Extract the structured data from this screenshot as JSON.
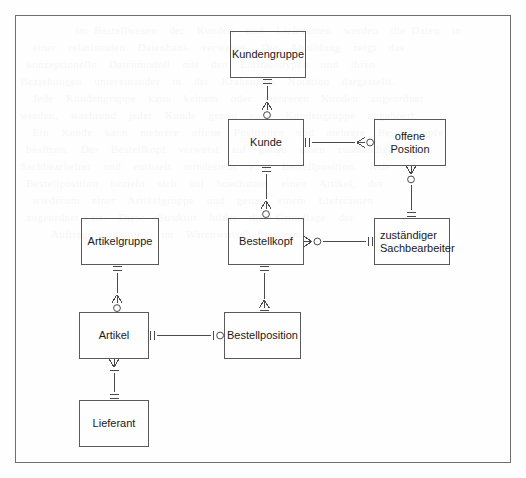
{
  "diagram": {
    "type": "entity-relationship-diagram",
    "notation": "crow's foot (Martin) notation",
    "frame": {
      "x": 15,
      "y": 15,
      "width": 496,
      "height": 448,
      "border_color": "#6e6e6e"
    },
    "canvas": {
      "width": 526,
      "height": 478,
      "background": "#fefefe"
    },
    "entity_border_color": "#5a5a5a",
    "line_color": "#4a4a4a",
    "text_color": "#1a1a1a",
    "entities": [
      {
        "id": "kundengruppe",
        "label": "Kundengruppe",
        "x": 230,
        "y": 31,
        "width": 76,
        "height": 47,
        "align": "center"
      },
      {
        "id": "kunde",
        "label": "Kunde",
        "x": 228,
        "y": 119,
        "width": 76,
        "height": 47,
        "align": "center"
      },
      {
        "id": "offene_position",
        "label": "offene\nPosition",
        "x": 374,
        "y": 119,
        "width": 72,
        "height": 47,
        "align": "center"
      },
      {
        "id": "artikelgruppe",
        "label": "Artikelgruppe",
        "x": 81,
        "y": 218,
        "width": 78,
        "height": 47,
        "align": "center"
      },
      {
        "id": "bestellkopf",
        "label": "Bestellkopf",
        "x": 228,
        "y": 218,
        "width": 76,
        "height": 47,
        "align": "center"
      },
      {
        "id": "zustaendiger_sachbearbeiter",
        "label": "zuständiger\nSachbearbeiter",
        "x": 374,
        "y": 218,
        "width": 76,
        "height": 47,
        "align": "left"
      },
      {
        "id": "artikel",
        "label": "Artikel",
        "x": 79,
        "y": 312,
        "width": 70,
        "height": 47,
        "align": "center"
      },
      {
        "id": "bestellposition",
        "label": "Bestellposition",
        "x": 224,
        "y": 312,
        "width": 77,
        "height": 47,
        "align": "center"
      },
      {
        "id": "lieferant",
        "label": "Lieferant",
        "x": 79,
        "y": 400,
        "width": 70,
        "height": 47,
        "align": "center"
      }
    ],
    "relationships": [
      {
        "id": "kundengruppe-kunde",
        "from": "kundengruppe",
        "to": "kunde",
        "orientation": "vertical",
        "from_cardinality": "one-and-only-one",
        "to_cardinality": "zero-or-many",
        "from_symbol": "||",
        "to_symbol": "o<"
      },
      {
        "id": "kunde-offene-position",
        "from": "kunde",
        "to": "offene_position",
        "orientation": "horizontal",
        "from_cardinality": "one-and-only-one",
        "to_cardinality": "zero-or-many",
        "from_symbol": "||",
        "to_symbol": "o<"
      },
      {
        "id": "kunde-bestellkopf",
        "from": "kunde",
        "to": "bestellkopf",
        "orientation": "vertical",
        "from_cardinality": "one-and-only-one",
        "to_cardinality": "zero-or-many",
        "from_symbol": "||",
        "to_symbol": "o<"
      },
      {
        "id": "offene-position-sachbearbeiter",
        "from": "offene_position",
        "to": "zustaendiger_sachbearbeiter",
        "orientation": "vertical",
        "from_cardinality": "zero-or-many",
        "to_cardinality": "one-and-only-one",
        "from_symbol": "<o",
        "to_symbol": "||"
      },
      {
        "id": "bestellkopf-sachbearbeiter",
        "from": "bestellkopf",
        "to": "zustaendiger_sachbearbeiter",
        "orientation": "horizontal",
        "from_cardinality": "zero-or-many",
        "to_cardinality": "one-and-only-one",
        "from_symbol": "<o",
        "to_symbol": "||"
      },
      {
        "id": "artikelgruppe-artikel",
        "from": "artikelgruppe",
        "to": "artikel",
        "orientation": "vertical",
        "from_cardinality": "one-and-only-one",
        "to_cardinality": "zero-or-many",
        "from_symbol": "||",
        "to_symbol": "o<"
      },
      {
        "id": "bestellkopf-bestellposition",
        "from": "bestellkopf",
        "to": "bestellposition",
        "orientation": "vertical",
        "from_cardinality": "one-and-only-one",
        "to_cardinality": "one-or-many",
        "from_symbol": "||",
        "to_symbol": "|<"
      },
      {
        "id": "artikel-bestellposition",
        "from": "artikel",
        "to": "bestellposition",
        "orientation": "horizontal",
        "from_cardinality": "one-and-only-one",
        "to_cardinality": "zero-or-one",
        "from_symbol": "||",
        "to_symbol": "o|"
      },
      {
        "id": "artikel-lieferant",
        "from": "artikel",
        "to": "lieferant",
        "orientation": "vertical",
        "from_cardinality": "one-or-many",
        "to_cardinality": "one-and-only-one",
        "from_symbol": "<|",
        "to_symbol": "||"
      }
    ]
  },
  "watermark": {
    "text": "          im Bestellwesen  der  Kunden  und  Lieferanten  werden  die Daten  in\n   einer  relationalen  Datenbank  verwaltet.  Die  Abbildung  zeigt  das\n  konzeptionelle  Datenmodell  mit  den  Entitaetstypen  und  ihren\n Beziehungen  untereinander  in  der  Krahenfuss  Notation  dargestellt.\n   Jede  Kundengruppe  kann  keinem  oder  mehreren  Kunden  zugeordnet\n werden,  waehrend  jeder  Kunde  genau  einer  Kundengruppe  angehoert.\n   Ein  Kunde  kann  mehrere  offene  Positionen  und  mehrere  Bestellkoepfe\n  besitzen.  Der  Bestellkopf  verweist  auf  genau  einen  zustaendigen\n Sachbearbeiter  und  enthaelt  mindestens  eine  Bestellposition.  Jede\n  Bestellposition  bezieht  sich  auf  hoechstens  einen  Artikel,  der\n   wiederum  einer  Artikelgruppe  und  genau  einem  Lieferanten\n  zugeordnet  ist.  Diese  Struktur  bildet  die  Grundlage  der\n      Auftragsbearbeitung  im  Warenwirtschaftssystem."
  }
}
